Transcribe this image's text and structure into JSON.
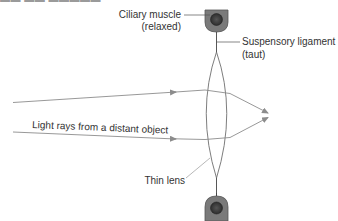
{
  "figure": {
    "top_cutoff_text": "▬▬ ▬▬ ▬▬▬▬▬ ▬ ▬▬▬▬",
    "labels": {
      "ciliary_muscle_line1": "Ciliary muscle",
      "ciliary_muscle_line2": "(relaxed)",
      "suspensory_ligament_line1": "Suspensory ligament",
      "suspensory_ligament_line2": "(taut)",
      "light_rays": "Light rays from a distant object",
      "thin_lens": "Thin lens"
    },
    "colors": {
      "ray": "#8c8c8c",
      "lens_outline": "#6e6e6e",
      "muscle_holder": "#7a7a7a",
      "muscle_core": "#3a3a3a",
      "text": "#333333"
    }
  }
}
